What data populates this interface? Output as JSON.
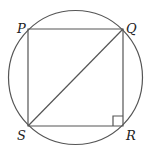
{
  "diagram": {
    "type": "inscribed-square-in-circle",
    "circle": {
      "cx": 75.5,
      "cy": 77.5,
      "r": 67
    },
    "vertices": {
      "P": {
        "label": "P",
        "x": 28,
        "y": 29,
        "label_x": 17,
        "label_y": 33
      },
      "Q": {
        "label": "Q",
        "x": 123,
        "y": 29,
        "label_x": 126,
        "label_y": 33
      },
      "R": {
        "label": "R",
        "x": 123,
        "y": 126,
        "label_x": 126,
        "label_y": 140
      },
      "S": {
        "label": "S",
        "x": 28,
        "y": 126,
        "label_x": 17,
        "label_y": 140
      }
    },
    "diagonal": {
      "from": "S",
      "to": "Q"
    },
    "right_angle_marker": {
      "at": "R",
      "size": 10
    },
    "colors": {
      "stroke": "#555555",
      "label": "#222222",
      "background": "#ffffff"
    }
  }
}
